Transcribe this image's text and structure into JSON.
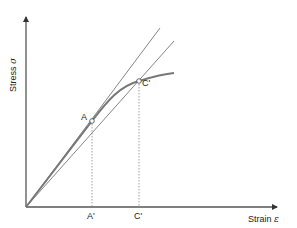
{
  "diagram": {
    "type": "stress-strain curve with tangent and secant moduli",
    "axes": {
      "y_label": "Stress",
      "y_symbol": "σ",
      "x_label": "Strain",
      "x_symbol": "ε"
    },
    "points": [
      {
        "id": "A",
        "label": "A"
      },
      {
        "id": "C",
        "label": "C'"
      }
    ],
    "x_ticks": [
      {
        "label": "A'"
      },
      {
        "label": "C'"
      }
    ],
    "colors": {
      "axis": "#555555",
      "curve": "#777777",
      "guide": "#666666",
      "dotted": "#888888",
      "text": "#222222"
    }
  }
}
